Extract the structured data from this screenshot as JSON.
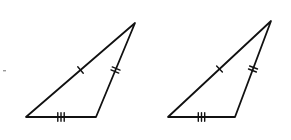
{
  "figure": {
    "stroke_color": "#111111",
    "background": "#ffffff",
    "triangles": [
      {
        "id": "left",
        "vertices": [
          [
            26,
            117
          ],
          [
            96,
            117
          ],
          [
            135,
            23
          ]
        ],
        "sides": [
          {
            "from": 0,
            "to": 1,
            "tick_marks": 3
          },
          {
            "from": 1,
            "to": 2,
            "tick_marks": 2
          },
          {
            "from": 2,
            "to": 0,
            "tick_marks": 1
          }
        ]
      },
      {
        "id": "right",
        "vertices": [
          [
            168,
            117
          ],
          [
            235,
            117
          ],
          [
            271,
            21
          ]
        ],
        "sides": [
          {
            "from": 0,
            "to": 1,
            "tick_marks": 3
          },
          {
            "from": 1,
            "to": 2,
            "tick_marks": 2
          },
          {
            "from": 2,
            "to": 0,
            "tick_marks": 1
          }
        ]
      }
    ]
  }
}
